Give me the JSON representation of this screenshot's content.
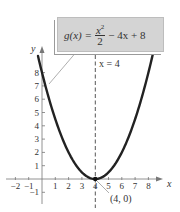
{
  "formula": {
    "lhs": "g(x) =",
    "numerator": "x",
    "numerator_exp": "2",
    "denominator": "2",
    "rhs": "− 4x + 8"
  },
  "axis_of_symmetry_label": "x = 4",
  "vertex_label": "(4, 0)",
  "axes": {
    "x_label": "x",
    "y_label": "y"
  },
  "colors": {
    "curve": "#222222",
    "axis": "#777777",
    "box_fill": "#d4d4d4",
    "text": "#333333"
  },
  "chart_data": {
    "type": "line",
    "xlabel": "x",
    "ylabel": "y",
    "xlim": [
      -2.5,
      9
    ],
    "ylim": [
      -1.8,
      9.5
    ],
    "x_ticks": [
      -2,
      -1,
      1,
      2,
      3,
      4,
      5,
      6,
      7,
      8
    ],
    "y_ticks": [
      -1,
      1,
      2,
      3,
      4,
      5,
      6,
      7,
      8
    ],
    "grid": false,
    "series": [
      {
        "name": "g(x) = x²/2 − 4x + 8",
        "x": [
          -0.3,
          0,
          1,
          2,
          3,
          4,
          5,
          6,
          7,
          8,
          8.4
        ],
        "y": [
          9.25,
          8,
          4.5,
          2,
          0.5,
          0,
          0.5,
          2,
          4.5,
          8,
          9.68
        ]
      }
    ],
    "annotations": [
      {
        "text": "x = 4",
        "type": "vertical dashed line",
        "x": 4
      },
      {
        "text": "(4, 0)",
        "type": "point",
        "x": 4,
        "y": 0
      }
    ]
  }
}
